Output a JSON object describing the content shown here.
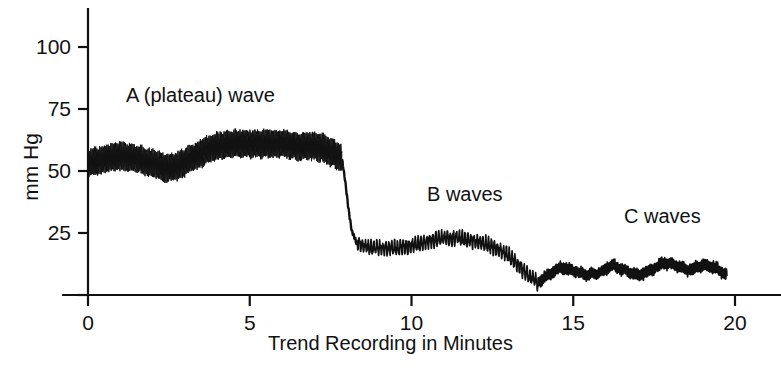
{
  "figure": {
    "background_color": "#ffffff",
    "ink_color": "#111111",
    "caption_fragment": ""
  },
  "chart_data": {
    "type": "line",
    "title": "",
    "subtitle": "",
    "xlabel": "Trend Recording in Minutes",
    "ylabel": "mm Hg",
    "xlim": [
      0,
      20
    ],
    "ylim": [
      0,
      110
    ],
    "grid": false,
    "legend_position": "none",
    "xticks": [
      0,
      5,
      10,
      15,
      20
    ],
    "xtick_labels": [
      "0",
      "5",
      "10",
      "15",
      "20"
    ],
    "yticks": [
      25,
      50,
      75,
      100
    ],
    "ytick_labels": [
      "25",
      "50",
      "75",
      "100"
    ],
    "untick_labeled_zero": true,
    "annotations": [
      {
        "id": "a-wave",
        "text": "A (plateau) wave",
        "x_minutes": 2.4,
        "y_mmhg": 78
      },
      {
        "id": "b-wave",
        "text": "B waves",
        "x_minutes": 11.5,
        "y_mmhg": 39
      },
      {
        "id": "c-wave",
        "text": "C waves",
        "x_minutes": 17.6,
        "y_mmhg": 32
      }
    ],
    "series": [
      {
        "name": "Intracranial pressure trend",
        "color": "#111111",
        "description": "Continuous ICP trend showing a sustained A (plateau) wave near 55 mmHg, an abrupt fall at 8 minutes, rhythmic B waves near 20 mmHg, and low-amplitude C waves near 10 mmHg.",
        "segments": [
          {
            "name": "a-plateau-wave",
            "x_start": 0.0,
            "x_end": 7.85,
            "band": true,
            "band_thickness_mmhg": 7,
            "envelope_x": [
              0.0,
              0.5,
              1.0,
              1.5,
              2.0,
              2.4,
              2.8,
              3.2,
              3.6,
              4.0,
              4.5,
              5.0,
              5.5,
              6.0,
              6.5,
              7.0,
              7.3,
              7.6,
              7.85
            ],
            "envelope_y": [
              53,
              55,
              56,
              55,
              53,
              51,
              52,
              55,
              58,
              60,
              61,
              61,
              61,
              61,
              60,
              60,
              59,
              57,
              55
            ],
            "noise_amplitude_mmhg": 2.5,
            "noise_frequency_per_minute": 26
          },
          {
            "name": "abrupt-fall",
            "x_start": 7.85,
            "x_end": 8.3,
            "band": false,
            "envelope_x": [
              7.85,
              7.95,
              8.05,
              8.15,
              8.3
            ],
            "envelope_y": [
              55,
              46,
              35,
              26,
              21
            ],
            "noise_amplitude_mmhg": 0.8,
            "noise_frequency_per_minute": 20
          },
          {
            "name": "b-waves",
            "x_start": 8.3,
            "x_end": 13.9,
            "band": false,
            "envelope_x": [
              8.3,
              8.7,
              9.1,
              9.6,
              10.1,
              10.6,
              11.0,
              11.4,
              11.8,
              12.2,
              12.6,
              13.0,
              13.3,
              13.6,
              13.9
            ],
            "envelope_y": [
              21,
              19,
              19,
              19,
              20,
              22,
              23,
              23,
              22,
              21,
              19,
              16,
              12,
              8,
              5
            ],
            "noise_amplitude_mmhg": 3.2,
            "noise_frequency_per_minute": 11
          },
          {
            "name": "c-waves",
            "x_start": 13.9,
            "x_end": 19.75,
            "band": false,
            "envelope_x": [
              13.9,
              14.2,
              14.6,
              15.0,
              15.4,
              15.8,
              16.2,
              16.6,
              17.0,
              17.4,
              17.8,
              18.2,
              18.6,
              19.0,
              19.4,
              19.75
            ],
            "envelope_y": [
              5,
              8,
              11,
              10,
              8,
              9,
              12,
              10,
              8,
              10,
              13,
              12,
              10,
              12,
              11,
              8
            ],
            "noise_amplitude_mmhg": 2.6,
            "noise_frequency_per_minute": 22
          }
        ]
      }
    ]
  }
}
